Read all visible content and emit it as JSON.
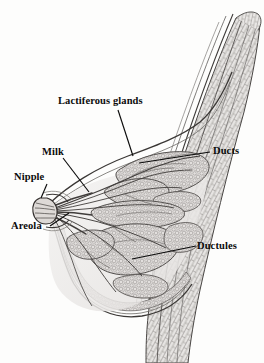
{
  "figure": {
    "kind": "anatomical-illustration",
    "background_color": "#fdfdfc",
    "ink_color": "#2b2b2b",
    "label_color": "#0b0b0b",
    "tissue_fill": "#e8e6e4",
    "tissue_shade": "#cfcccb"
  },
  "labels": {
    "lactiferous_glands": "Lactiferous glands",
    "milk": "Milk",
    "nipple": "Nipple",
    "areola": "Areola",
    "ducts": "Ducts",
    "ductules": "Ductules"
  },
  "structures": [
    {
      "name": "chest-wall",
      "label": null
    },
    {
      "name": "pectoral-tissue-band",
      "label": null
    },
    {
      "name": "lactiferous-glands",
      "label": "Lactiferous glands"
    },
    {
      "name": "milk-sinus",
      "label": "Milk"
    },
    {
      "name": "nipple",
      "label": "Nipple"
    },
    {
      "name": "areola",
      "label": "Areola"
    },
    {
      "name": "ducts",
      "label": "Ducts"
    },
    {
      "name": "ductules",
      "label": "Ductules"
    },
    {
      "name": "breast-skin-contour",
      "label": null
    },
    {
      "name": "fatty-tissue",
      "label": null
    }
  ]
}
